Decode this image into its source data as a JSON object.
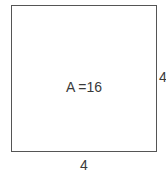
{
  "figure": {
    "shape_name": "square",
    "area_label": "A =16",
    "bottom_side_label": "4",
    "right_side_label": "4",
    "stroke_color": "#555555",
    "fill_color": "#ffffff",
    "text_color": "#3a3a3a"
  }
}
